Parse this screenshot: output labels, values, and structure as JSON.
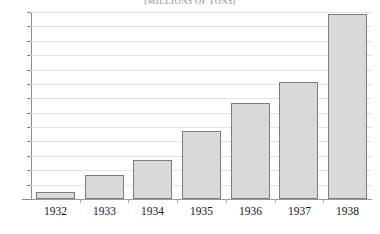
{
  "chart_data": {
    "type": "bar",
    "title": "(MILLIONS OF TONS)",
    "xlabel": "",
    "ylabel": "",
    "categories": [
      "1932",
      "1933",
      "1934",
      "1935",
      "1936",
      "1937",
      "1938"
    ],
    "values": [
      1.0,
      3.4,
      5.4,
      9.4,
      13.4,
      16.3,
      25.7
    ],
    "series": [
      {
        "name": "",
        "values": [
          1.0,
          3.4,
          5.4,
          9.4,
          13.4,
          16.3,
          25.7
        ]
      }
    ],
    "ylim": [
      0.0,
      26.0
    ],
    "y_tick_step": 2.0,
    "y_ticks": [
      "0.0",
      "2.0",
      "4.0",
      "6.0",
      "8.0",
      "10.0",
      "12.0",
      "14.0",
      "16.0",
      "18.0",
      "20.0",
      "22.0",
      "24.0",
      "26.0"
    ],
    "y_tick_values": [
      0,
      2,
      4,
      6,
      8,
      10,
      12,
      14,
      16,
      18,
      20,
      22,
      24,
      26
    ],
    "grid": true,
    "grid_orientation": "horizontal",
    "legend": false,
    "legend_position": "none",
    "bar_fill_color": "#d9d9d9",
    "bar_border_color": "#7d7d7d",
    "gridline_color": "#e2e2e2",
    "axis_color": "#8c8c8c",
    "text_color": "#141414",
    "background_color": "#ffffff"
  }
}
